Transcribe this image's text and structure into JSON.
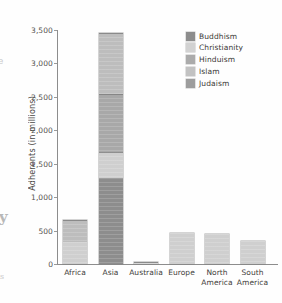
{
  "chart_data": {
    "type": "bar",
    "subtype": "stacked-bar",
    "title": "",
    "xlabel": "",
    "ylabel": "Adherents (in millions)",
    "ylim": [
      0,
      3500
    ],
    "ytick_values": [
      0,
      500,
      1000,
      1500,
      2000,
      2500,
      3000,
      3500
    ],
    "ytick_labels": [
      "0",
      "500",
      "1,000",
      "1,500",
      "2,000",
      "2,500",
      "3,000",
      "3,500"
    ],
    "grid": false,
    "legend_position": "top-right",
    "categories": [
      "Africa",
      "Asia",
      "Australia",
      "Europe",
      "North America",
      "South America"
    ],
    "series": [
      {
        "name": "Buddhism",
        "color": "#8d8d8d",
        "values": [
          0,
          1280,
          0,
          0,
          0,
          0
        ]
      },
      {
        "name": "Christianity",
        "color": "#cfcfcf",
        "values": [
          330,
          400,
          20,
          470,
          450,
          350
        ]
      },
      {
        "name": "Hinduism",
        "color": "#a8a8a8",
        "values": [
          0,
          870,
          0,
          0,
          0,
          0
        ]
      },
      {
        "name": "Islam",
        "color": "#bdbdbd",
        "values": [
          330,
          900,
          5,
          0,
          0,
          0
        ]
      },
      {
        "name": "Judaism",
        "color": "#9b9b9b",
        "values": [
          0,
          0,
          0,
          0,
          0,
          0
        ]
      }
    ],
    "totals": [
      660,
      3450,
      25,
      470,
      450,
      350
    ],
    "stack_breakpoints": {
      "Asia": [
        1280,
        1680,
        2550,
        3450
      ],
      "Africa": [
        330,
        660
      ]
    }
  },
  "axis": {
    "y_title": "Adherents (in millions)",
    "ticks": [
      {
        "label": "3,500",
        "value": 3500
      },
      {
        "label": "3,000",
        "value": 3000
      },
      {
        "label": "2,500",
        "value": 2500
      },
      {
        "label": "2,000",
        "value": 2000
      },
      {
        "label": "1,500",
        "value": 1500
      },
      {
        "label": "1,000",
        "value": 1000
      },
      {
        "label": "500",
        "value": 500
      },
      {
        "label": "0",
        "value": 0
      }
    ],
    "categories": [
      {
        "label": "Africa"
      },
      {
        "label": "Asia"
      },
      {
        "label": "Australia"
      },
      {
        "label": "Europe"
      },
      {
        "label": "North\nAmerica"
      },
      {
        "label": "South\nAmerica"
      }
    ]
  },
  "legend": {
    "items": [
      {
        "label": "Buddhism",
        "color": "#8d8d8d"
      },
      {
        "label": "Christianity",
        "color": "#d2d2d2"
      },
      {
        "label": "Hinduism",
        "color": "#ababab"
      },
      {
        "label": "Islam",
        "color": "#c2c2c2"
      },
      {
        "label": "Judaism",
        "color": "#9d9d9d"
      }
    ]
  },
  "scan_artifacts": {
    "left_mark_1": "e",
    "left_mark_2": "y",
    "left_mark_3": "s"
  }
}
